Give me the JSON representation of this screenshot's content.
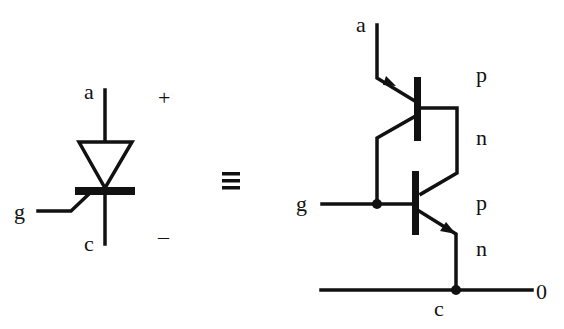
{
  "diagram": {
    "scr_symbol": {
      "labels": {
        "anode": "a",
        "gate": "g",
        "cathode": "c",
        "plus": "+",
        "minus": "–"
      }
    },
    "equivalence": "≡",
    "equivalent_circuit": {
      "labels": {
        "anode": "a",
        "gate": "g",
        "cathode": "c",
        "ground": "0",
        "layers": [
          "p",
          "n",
          "p",
          "n"
        ]
      }
    },
    "colors": {
      "line": "#111111",
      "background": "#ffffff"
    }
  }
}
